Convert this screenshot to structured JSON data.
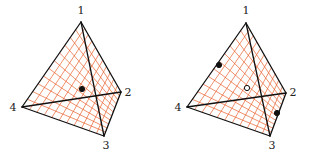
{
  "colors": {
    "edge": "#111111",
    "mesh": "#e8602c",
    "background": "#ffffff"
  },
  "panels": [
    {
      "name": "left-tetrahedron",
      "vertices": {
        "1": [
          81,
          22
        ],
        "2": [
          121,
          92
        ],
        "3": [
          104,
          136
        ],
        "4": [
          22,
          107
        ]
      },
      "labels": [
        {
          "text": "1",
          "x": 81,
          "y": 14
        },
        {
          "text": "2",
          "x": 128,
          "y": 96
        },
        {
          "text": "3",
          "x": 106,
          "y": 149
        },
        {
          "text": "4",
          "x": 13,
          "y": 111
        }
      ],
      "points": [
        {
          "type": "filled",
          "x": 82,
          "y": 89
        }
      ]
    },
    {
      "name": "right-tetrahedron",
      "vertices": {
        "1": [
          246,
          23
        ],
        "2": [
          286,
          93
        ],
        "3": [
          270,
          136
        ],
        "4": [
          187,
          107
        ]
      },
      "labels": [
        {
          "text": "1",
          "x": 246,
          "y": 14
        },
        {
          "text": "2",
          "x": 293,
          "y": 96
        },
        {
          "text": "3",
          "x": 272,
          "y": 149
        },
        {
          "text": "4",
          "x": 178,
          "y": 111
        }
      ],
      "points": [
        {
          "type": "filled",
          "x": 219,
          "y": 65
        },
        {
          "type": "open",
          "x": 247,
          "y": 88
        },
        {
          "type": "filled",
          "x": 277,
          "y": 113
        }
      ]
    }
  ]
}
